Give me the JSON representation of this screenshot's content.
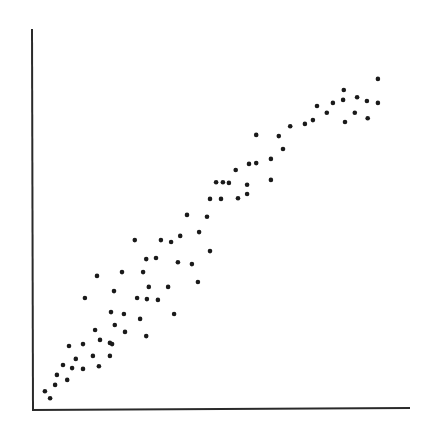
{
  "chart_data": {
    "type": "scatter",
    "title": "",
    "xlabel": "",
    "ylabel": "",
    "xlim": [
      0,
      100
    ],
    "ylim": [
      0,
      100
    ],
    "grid": false,
    "legend": null,
    "tick_labels": {
      "x": [],
      "y": []
    },
    "series": [
      {
        "name": "points",
        "color": "#1a1a1a",
        "points": [
          [
            3.4,
            4.9
          ],
          [
            4.8,
            3.1
          ],
          [
            6.1,
            6.6
          ],
          [
            6.6,
            9.2
          ],
          [
            8.2,
            11.8
          ],
          [
            9.3,
            7.9
          ],
          [
            9.8,
            16.8
          ],
          [
            10.6,
            11.0
          ],
          [
            11.6,
            13.4
          ],
          [
            13.5,
            17.3
          ],
          [
            13.5,
            10.8
          ],
          [
            14.0,
            29.4
          ],
          [
            16.1,
            14.2
          ],
          [
            16.7,
            21.0
          ],
          [
            17.2,
            35.2
          ],
          [
            17.7,
            11.5
          ],
          [
            18.0,
            18.4
          ],
          [
            20.6,
            17.6
          ],
          [
            20.6,
            14.2
          ],
          [
            21.2,
            17.3
          ],
          [
            21.7,
            31.2
          ],
          [
            20.9,
            25.7
          ],
          [
            21.9,
            22.3
          ],
          [
            23.8,
            36.2
          ],
          [
            24.3,
            25.2
          ],
          [
            24.6,
            20.5
          ],
          [
            27.2,
            44.6
          ],
          [
            27.8,
            29.4
          ],
          [
            28.6,
            23.9
          ],
          [
            29.4,
            36.2
          ],
          [
            30.2,
            39.6
          ],
          [
            30.2,
            19.4
          ],
          [
            30.4,
            29.1
          ],
          [
            30.9,
            32.3
          ],
          [
            32.8,
            39.9
          ],
          [
            33.3,
            28.9
          ],
          [
            34.1,
            44.6
          ],
          [
            36.0,
            32.3
          ],
          [
            36.8,
            44.1
          ],
          [
            37.6,
            25.2
          ],
          [
            38.6,
            38.8
          ],
          [
            39.2,
            45.7
          ],
          [
            41.0,
            51.2
          ],
          [
            42.3,
            38.3
          ],
          [
            43.9,
            33.6
          ],
          [
            44.2,
            46.7
          ],
          [
            46.3,
            50.7
          ],
          [
            47.1,
            55.4
          ],
          [
            47.1,
            41.7
          ],
          [
            48.7,
            59.8
          ],
          [
            50.0,
            55.4
          ],
          [
            50.5,
            59.8
          ],
          [
            52.1,
            59.6
          ],
          [
            53.9,
            63.0
          ],
          [
            54.5,
            55.6
          ],
          [
            56.9,
            59.1
          ],
          [
            56.9,
            56.7
          ],
          [
            57.4,
            64.6
          ],
          [
            59.3,
            72.2
          ],
          [
            59.3,
            64.8
          ],
          [
            63.2,
            65.9
          ],
          [
            63.2,
            60.4
          ],
          [
            65.3,
            71.9
          ],
          [
            66.4,
            68.5
          ],
          [
            68.3,
            74.5
          ],
          [
            72.2,
            75.1
          ],
          [
            74.3,
            76.1
          ],
          [
            75.4,
            79.8
          ],
          [
            78.0,
            78.0
          ],
          [
            79.6,
            80.6
          ],
          [
            82.8,
            75.6
          ],
          [
            82.3,
            81.4
          ],
          [
            82.5,
            84.0
          ],
          [
            85.4,
            78.0
          ],
          [
            86.0,
            82.1
          ],
          [
            88.6,
            81.1
          ],
          [
            88.8,
            76.6
          ],
          [
            91.5,
            80.6
          ],
          [
            91.5,
            86.9
          ]
        ]
      }
    ]
  },
  "plot": {
    "background": "#ffffff",
    "axis_color": "#2a2a2a",
    "point_radius": 2.3
  }
}
